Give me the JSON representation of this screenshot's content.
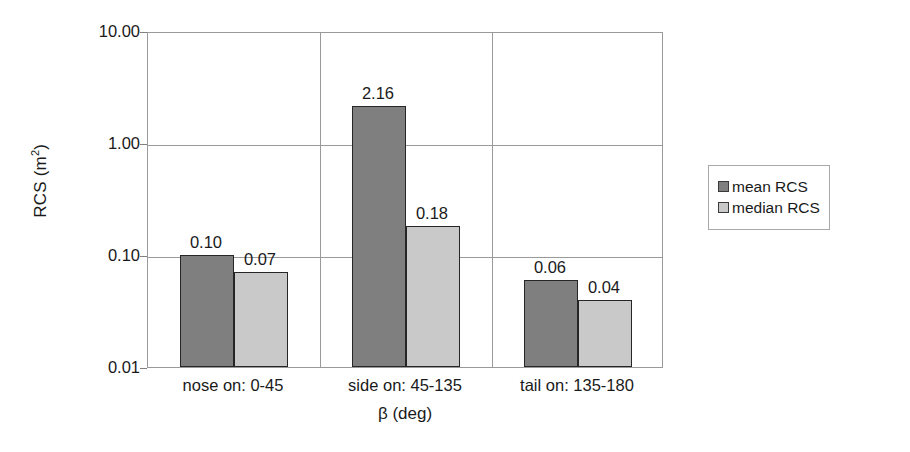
{
  "chart_data": {
    "type": "bar",
    "title": "",
    "xlabel": "β (deg)",
    "ylabel": "RCS (m²)",
    "ylabel_base": "RCS (m",
    "ylabel_exp": "2",
    "ylabel_close": ")",
    "yscale": "log",
    "ylim": [
      0.01,
      10.0
    ],
    "ytick_labels": [
      "10.00",
      "1.00",
      "0.10",
      "0.01"
    ],
    "ytick_values": [
      10.0,
      1.0,
      0.1,
      0.01
    ],
    "grid": "horizontal-and-category-separators",
    "legend_position": "right",
    "categories": [
      "nose on:  0-45",
      "side on: 45-135",
      "tail on: 135-180"
    ],
    "series": [
      {
        "name": "mean RCS",
        "color": "#7f7f7f",
        "values": [
          0.1,
          2.16,
          0.06
        ],
        "labels": [
          "0.10",
          "2.16",
          "0.06"
        ]
      },
      {
        "name": "median RCS",
        "color": "#c9c9c9",
        "values": [
          0.07,
          0.18,
          0.04
        ],
        "labels": [
          "0.07",
          "0.18",
          "0.04"
        ]
      }
    ]
  },
  "legend": {
    "items": [
      {
        "label": "mean RCS",
        "color": "#7f7f7f"
      },
      {
        "label": "median RCS",
        "color": "#c9c9c9"
      }
    ]
  }
}
